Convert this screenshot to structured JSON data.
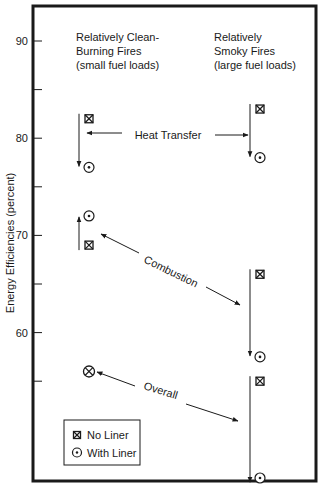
{
  "chart_data": {
    "type": "scatter",
    "title": "",
    "xlabel": "",
    "ylabel": "Energy Efficiencies (percent)",
    "ylim": [
      44.5,
      93.5
    ],
    "yticks": [
      55,
      60,
      65,
      70,
      75,
      80,
      85,
      90
    ],
    "ytick_labels": [
      {
        "value": 90,
        "label": "90"
      },
      {
        "value": 80,
        "label": "80"
      },
      {
        "value": 70,
        "label": "70"
      },
      {
        "value": 60,
        "label": "60"
      }
    ],
    "grid": false,
    "categories": [
      "Relatively Clean-Burning Fires (small fuel loads)",
      "Relatively Smoky Fires (large fuel loads)"
    ],
    "category_headers": [
      {
        "lines": [
          "Relatively Clean-",
          "Burning Fires",
          "(small fuel loads)"
        ]
      },
      {
        "lines": [
          "Relatively",
          "Smoky Fires",
          "(large fuel loads)"
        ]
      }
    ],
    "groups": [
      {
        "name": "Heat Transfer",
        "series": [
          {
            "name": "No Liner",
            "values": [
              82,
              83
            ]
          },
          {
            "name": "With Liner",
            "values": [
              77,
              78
            ]
          }
        ]
      },
      {
        "name": "Combustion",
        "series": [
          {
            "name": "No Liner",
            "values": [
              69,
              66
            ]
          },
          {
            "name": "With Liner",
            "values": [
              72,
              57.5
            ]
          }
        ]
      },
      {
        "name": "Overall",
        "series": [
          {
            "name": "No Liner",
            "values": [
              56,
              55
            ]
          },
          {
            "name": "With Liner",
            "values": [
              56,
              44.5
            ]
          }
        ]
      }
    ],
    "annotations": [
      {
        "text": "Heat Transfer",
        "type": "double-arrow-horizontal"
      },
      {
        "text": "Combustion",
        "type": "double-arrow-diagonal"
      },
      {
        "text": "Overall",
        "type": "double-arrow-diagonal"
      }
    ],
    "legend": {
      "position": "lower-left",
      "entries": [
        {
          "label": "No Liner",
          "marker": "boxed-x"
        },
        {
          "label": "With Liner",
          "marker": "circled-dot"
        }
      ]
    }
  },
  "colors": {
    "ink": "#1a1a1a",
    "background": "#ffffff"
  }
}
